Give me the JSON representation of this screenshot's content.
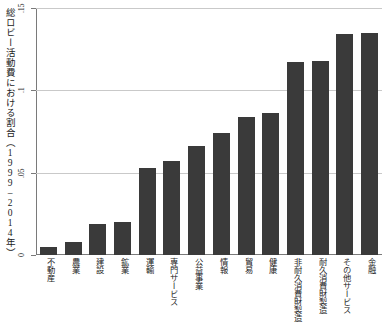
{
  "chart_data": {
    "type": "bar",
    "title": "",
    "subtitle": "",
    "xlabel": "",
    "ylabel": "総ロビー活動費における割合（1999–2014年）",
    "ylim": [
      0,
      0.15
    ],
    "yticks": [
      0,
      0.05,
      0.1,
      0.15
    ],
    "ytick_labels": [
      "0",
      ".05",
      ".1",
      ".15"
    ],
    "grid": true,
    "legend": "none",
    "orientation": "vertical",
    "bar_color": "#3a3a3a",
    "categories": [
      "不動産",
      "農業",
      "建設",
      "鉱業",
      "運輸",
      "専門サービス",
      "公益事業",
      "情報",
      "貿易",
      "健康",
      "非耐久消費財製造",
      "耐久消費財製造",
      "その他サービス",
      "金融"
    ],
    "values": [
      0.005,
      0.008,
      0.019,
      0.02,
      0.053,
      0.057,
      0.066,
      0.074,
      0.084,
      0.086,
      0.117,
      0.118,
      0.134,
      0.135
    ]
  }
}
